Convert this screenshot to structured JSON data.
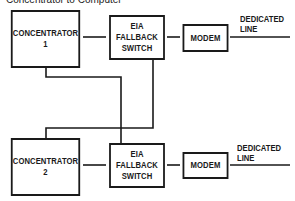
{
  "caption": "Concentrator to Computer",
  "diagram": {
    "groups": [
      {
        "concentrator": {
          "line1": "CONCENTRATOR",
          "line2": "1"
        },
        "switch": {
          "line1": "EIA",
          "line2": "FALLBACK",
          "line3": "SWITCH"
        },
        "modem": "MODEM",
        "line_label": {
          "line1": "DEDICATED",
          "line2": "LINE"
        }
      },
      {
        "concentrator": {
          "line1": "CONCENTRATOR",
          "line2": "2"
        },
        "switch": {
          "line1": "EIA",
          "line2": "FALLBACK",
          "line3": "SWITCH"
        },
        "modem": "MODEM",
        "line_label": {
          "line1": "DEDICATED",
          "line2": "LINE"
        }
      }
    ],
    "line_color": "#1a1a1a"
  }
}
